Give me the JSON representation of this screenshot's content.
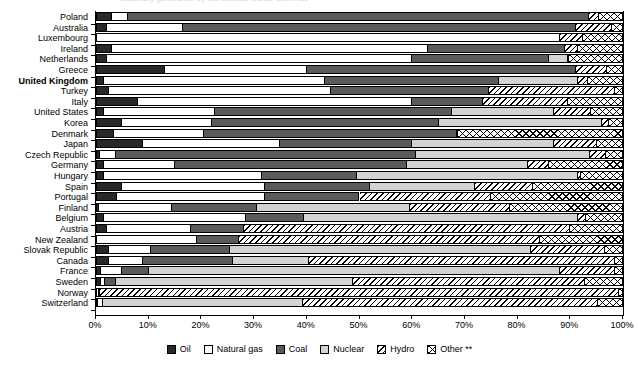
{
  "top_clipped_text": "Electricity generation by fuel source, OECD countries",
  "chart_data": {
    "type": "bar",
    "orientation": "horizontal",
    "stacked": true,
    "title": "",
    "xlabel": "",
    "ylabel": "",
    "xlim": [
      0,
      100
    ],
    "xticks": [
      "0%",
      "10%",
      "20%",
      "30%",
      "40%",
      "50%",
      "60%",
      "70%",
      "80%",
      "90%",
      "100%"
    ],
    "xtick_values": [
      0,
      10,
      20,
      30,
      40,
      50,
      60,
      70,
      80,
      90,
      100
    ],
    "grid": false,
    "legend_position": "bottom",
    "series": [
      {
        "name": "Oil",
        "key": "oil",
        "fill": "solid-black",
        "color": "#282828"
      },
      {
        "name": "Natural gas",
        "key": "gas",
        "fill": "solid-white",
        "color": "#ffffff"
      },
      {
        "name": "Coal",
        "key": "coal",
        "fill": "solid-darkgray",
        "color": "#5a5a5a"
      },
      {
        "name": "Nuclear",
        "key": "nuclear",
        "fill": "solid-lightgray",
        "color": "#d3d3d3"
      },
      {
        "name": "Hydro",
        "key": "hydro",
        "fill": "diagonal-hatch",
        "color": "#ffffff"
      },
      {
        "name": "Other **",
        "key": "other",
        "fill": "cross-hatch",
        "color": "#ffffff"
      }
    ],
    "categories": [
      "Poland",
      "Australia",
      "Luxembourg",
      "Ireland",
      "Netherlands",
      "Greece",
      "United Kingdom",
      "Turkey",
      "Italy",
      "United States",
      "Korea",
      "Denmark",
      "Japan",
      "Czech Republic",
      "Germany",
      "Hungary",
      "Spain",
      "Portugal",
      "Finland",
      "Belgium",
      "Austria",
      "New Zealand",
      "Slovak Republic",
      "Canada",
      "France",
      "Sweden",
      "Norway",
      "Switzerland"
    ],
    "bold_categories": [
      "United Kingdom"
    ],
    "rows": [
      {
        "country": "Poland",
        "oil": 3.0,
        "gas": 3.0,
        "coal": 87.5,
        "nuclear": 0.0,
        "hydro": 2.0,
        "other": 4.5
      },
      {
        "country": "Australia",
        "oil": 2.0,
        "gas": 14.5,
        "coal": 74.5,
        "nuclear": 0.0,
        "hydro": 7.0,
        "other": 2.0
      },
      {
        "country": "Luxembourg",
        "oil": 0.0,
        "gas": 88.0,
        "coal": 0.0,
        "nuclear": 0.0,
        "hydro": 4.5,
        "other": 7.5
      },
      {
        "country": "Ireland",
        "oil": 3.0,
        "gas": 60.0,
        "coal": 26.0,
        "nuclear": 0.0,
        "hydro": 2.5,
        "other": 8.5
      },
      {
        "country": "Netherlands",
        "oil": 2.0,
        "gas": 58.0,
        "coal": 26.0,
        "nuclear": 3.5,
        "hydro": 0.2,
        "other": 10.3
      },
      {
        "country": "Greece",
        "oil": 13.0,
        "gas": 27.0,
        "coal": 51.0,
        "nuclear": 0.0,
        "hydro": 6.0,
        "other": 3.0
      },
      {
        "country": "United Kingdom",
        "oil": 1.5,
        "gas": 42.0,
        "coal": 33.0,
        "nuclear": 15.0,
        "hydro": 1.8,
        "other": 6.7
      },
      {
        "country": "Turkey",
        "oil": 2.5,
        "gas": 42.0,
        "coal": 30.0,
        "nuclear": 0.0,
        "hydro": 24.0,
        "other": 1.5
      },
      {
        "country": "Italy",
        "oil": 8.0,
        "gas": 52.0,
        "coal": 13.5,
        "nuclear": 0.0,
        "hydro": 16.0,
        "other": 10.5
      },
      {
        "country": "United States",
        "oil": 1.5,
        "gas": 21.0,
        "coal": 45.0,
        "nuclear": 19.5,
        "hydro": 7.0,
        "other": 6.0
      },
      {
        "country": "Korea",
        "oil": 5.0,
        "gas": 17.0,
        "coal": 43.0,
        "nuclear": 31.0,
        "hydro": 1.3,
        "other": 2.7
      },
      {
        "country": "Denmark",
        "oil": 3.5,
        "gas": 17.0,
        "coal": 48.0,
        "nuclear": 0.0,
        "hydro": 0.2,
        "other": 31.3
      },
      {
        "country": "Japan",
        "oil": 9.0,
        "gas": 26.0,
        "coal": 25.0,
        "nuclear": 27.0,
        "hydro": 8.0,
        "other": 5.0
      },
      {
        "country": "Czech Republic",
        "oil": 0.8,
        "gas": 3.0,
        "coal": 57.0,
        "nuclear": 33.0,
        "hydro": 3.0,
        "other": 3.2
      },
      {
        "country": "Germany",
        "oil": 1.5,
        "gas": 13.5,
        "coal": 44.0,
        "nuclear": 23.0,
        "hydro": 4.0,
        "other": 14.0
      },
      {
        "country": "Hungary",
        "oil": 1.5,
        "gas": 30.0,
        "coal": 18.0,
        "nuclear": 42.0,
        "hydro": 0.5,
        "other": 8.0
      },
      {
        "country": "Spain",
        "oil": 5.0,
        "gas": 27.0,
        "coal": 20.0,
        "nuclear": 20.0,
        "hydro": 11.0,
        "other": 17.0
      },
      {
        "country": "Portugal",
        "oil": 4.0,
        "gas": 28.0,
        "coal": 18.0,
        "nuclear": 0.0,
        "hydro": 25.0,
        "other": 25.0
      },
      {
        "country": "Finland",
        "oil": 0.5,
        "gas": 14.0,
        "coal": 16.0,
        "nuclear": 29.0,
        "hydro": 19.0,
        "other": 21.5
      },
      {
        "country": "Belgium",
        "oil": 1.5,
        "gas": 27.0,
        "coal": 11.0,
        "nuclear": 52.0,
        "hydro": 1.5,
        "other": 7.0
      },
      {
        "country": "Austria",
        "oil": 2.0,
        "gas": 16.0,
        "coal": 10.0,
        "nuclear": 0.0,
        "hydro": 62.0,
        "other": 10.0
      },
      {
        "country": "New Zealand",
        "oil": 0.2,
        "gas": 19.0,
        "coal": 8.0,
        "nuclear": 0.0,
        "hydro": 57.0,
        "other": 15.8
      },
      {
        "country": "Slovak Republic",
        "oil": 2.5,
        "gas": 8.0,
        "coal": 15.0,
        "nuclear": 57.0,
        "hydro": 14.0,
        "other": 3.5
      },
      {
        "country": "Canada",
        "oil": 2.5,
        "gas": 6.5,
        "coal": 17.0,
        "nuclear": 14.5,
        "hydro": 58.0,
        "other": 1.5
      },
      {
        "country": "France",
        "oil": 1.0,
        "gas": 4.0,
        "coal": 5.0,
        "nuclear": 78.0,
        "hydro": 10.5,
        "other": 1.5
      },
      {
        "country": "Sweden",
        "oil": 1.0,
        "gas": 0.8,
        "coal": 2.0,
        "nuclear": 45.0,
        "hydro": 44.0,
        "other": 7.2
      },
      {
        "country": "Norway",
        "oil": 0.1,
        "gas": 0.4,
        "coal": 0.3,
        "nuclear": 0.0,
        "hydro": 98.5,
        "other": 0.7
      },
      {
        "country": "Switzerland",
        "oil": 0.3,
        "gas": 1.0,
        "coal": 0.0,
        "nuclear": 38.0,
        "hydro": 56.0,
        "other": 4.7
      }
    ]
  },
  "legend": {
    "items": [
      {
        "label": "Oil",
        "key": "oil"
      },
      {
        "label": "Natural gas",
        "key": "gas"
      },
      {
        "label": "Coal",
        "key": "coal"
      },
      {
        "label": "Nuclear",
        "key": "nuclear"
      },
      {
        "label": "Hydro",
        "key": "hydro"
      },
      {
        "label": "Other **",
        "key": "other"
      }
    ]
  }
}
